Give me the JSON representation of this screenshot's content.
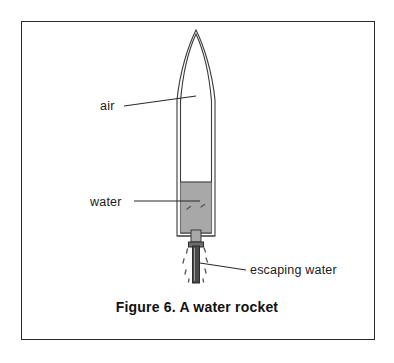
{
  "figure": {
    "caption": "Figure 6.  A water rocket",
    "frame": {
      "border_color": "#2b2b2b",
      "background": "#ffffff"
    }
  },
  "labels": {
    "air": "air",
    "water": "water",
    "escaping_water": "escaping water"
  },
  "diagram": {
    "title": "A water rocket",
    "type": "line-drawing",
    "parts": [
      {
        "name": "nose-cone",
        "label": "",
        "description": "pointed ogive nose of the bottle rocket",
        "fill": "#ffffff",
        "stroke": "#3a3a3a"
      },
      {
        "name": "air-chamber",
        "label": "air",
        "description": "upper interior of bottle filled with pressurised air",
        "fill": "#ffffff",
        "stroke": "#3a3a3a"
      },
      {
        "name": "water-chamber",
        "label": "water",
        "description": "lower interior of bottle filled with water",
        "fill": "#a8a8a8",
        "stroke": "#3a3a3a"
      },
      {
        "name": "nozzle",
        "label": "",
        "description": "narrow neck and launch tube at base of rocket",
        "fill": "#4a4a4a",
        "stroke": "#2b2b2b"
      },
      {
        "name": "water-jet",
        "label": "escaping water",
        "description": "droplets of water spraying out of the nozzle",
        "fill": "none",
        "stroke": "#555555"
      }
    ],
    "colors": {
      "water_fill": "#a8a8a8",
      "outline": "#3a3a3a",
      "nozzle": "#4a4a4a",
      "text": "#1a1a1a"
    }
  }
}
